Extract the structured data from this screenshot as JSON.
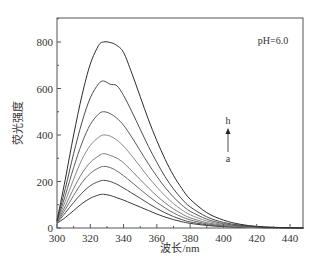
{
  "chart_data": {
    "type": "line",
    "title": "",
    "annotation": "pH=6.0",
    "xlabel": "波长/nm",
    "ylabel": "荧光强度",
    "xlim": [
      300,
      448
    ],
    "ylim": [
      0,
      900
    ],
    "xticks": [
      300,
      320,
      340,
      360,
      380,
      400,
      420,
      440
    ],
    "yticks": [
      0,
      200,
      400,
      600,
      800
    ],
    "grid": false,
    "legend": "arrow annotation from a (bottom) to h (top)",
    "arrow_labels": {
      "from": "a",
      "to": "h"
    },
    "x": [
      300,
      305,
      310,
      315,
      320,
      325,
      328,
      332,
      336,
      340,
      345,
      350,
      355,
      360,
      365,
      370,
      375,
      380,
      390,
      400,
      410,
      420,
      430,
      440,
      448
    ],
    "series": [
      {
        "name": "a",
        "values": [
          20,
          45,
          75,
          105,
          128,
          142,
          145,
          140,
          130,
          120,
          105,
          90,
          75,
          60,
          47,
          36,
          27,
          20,
          11,
          6,
          3,
          2,
          1,
          0,
          0
        ]
      },
      {
        "name": "b",
        "values": [
          22,
          65,
          110,
          150,
          182,
          200,
          205,
          200,
          188,
          172,
          150,
          128,
          105,
          84,
          65,
          49,
          36,
          26,
          14,
          7,
          4,
          2,
          1,
          0,
          0
        ]
      },
      {
        "name": "c",
        "values": [
          24,
          80,
          140,
          195,
          235,
          258,
          265,
          260,
          245,
          225,
          196,
          166,
          137,
          110,
          86,
          65,
          48,
          35,
          18,
          9,
          5,
          2,
          1,
          0,
          0
        ]
      },
      {
        "name": "d",
        "values": [
          25,
          95,
          170,
          235,
          282,
          310,
          320,
          312,
          300,
          280,
          245,
          208,
          172,
          138,
          108,
          82,
          61,
          44,
          23,
          12,
          6,
          3,
          1,
          0,
          0
        ]
      },
      {
        "name": "e",
        "values": [
          27,
          115,
          210,
          295,
          355,
          390,
          400,
          395,
          378,
          352,
          310,
          264,
          218,
          176,
          138,
          105,
          78,
          57,
          30,
          15,
          7,
          3,
          1,
          0,
          0
        ]
      },
      {
        "name": "f",
        "values": [
          28,
          140,
          260,
          365,
          445,
          490,
          500,
          492,
          472,
          442,
          390,
          332,
          275,
          222,
          174,
          133,
          99,
          72,
          38,
          19,
          9,
          4,
          2,
          1,
          0
        ]
      },
      {
        "name": "g",
        "values": [
          30,
          170,
          320,
          455,
          560,
          620,
          632,
          618,
          612,
          570,
          500,
          425,
          350,
          282,
          220,
          168,
          125,
          91,
          48,
          24,
          12,
          5,
          2,
          1,
          0
        ]
      },
      {
        "name": "h",
        "values": [
          32,
          210,
          400,
          570,
          705,
          785,
          800,
          798,
          785,
          755,
          665,
          565,
          465,
          375,
          295,
          226,
          170,
          124,
          66,
          34,
          16,
          7,
          3,
          1,
          0
        ]
      }
    ],
    "line_colors": [
      "#3a3a3a",
      "#4a4a4a",
      "#6a6a6a",
      "#7a7a7a",
      "#8a8a8a",
      "#5a5a5a",
      "#4a4a4a",
      "#2a2a2a"
    ]
  }
}
